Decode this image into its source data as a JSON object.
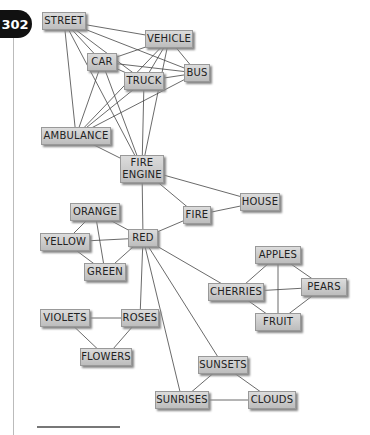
{
  "page_number": "302",
  "nodes": {
    "street": "STREET",
    "vehicle": "VEHICLE",
    "car": "CAR",
    "bus": "BUS",
    "truck": "TRUCK",
    "ambulance": "AMBULANCE",
    "fire_engine": "FIRE\nENGINE",
    "house": "HOUSE",
    "fire": "FIRE",
    "orange": "ORANGE",
    "yellow": "YELLOW",
    "red": "RED",
    "green": "GREEN",
    "apples": "APPLES",
    "cherries": "CHERRIES",
    "pears": "PEARS",
    "fruit": "FRUIT",
    "violets": "VIOLETS",
    "roses": "ROSES",
    "flowers": "FLOWERS",
    "sunsets": "SUNSETS",
    "sunrises": "SUNRISES",
    "clouds": "CLOUDS"
  },
  "edges": [
    [
      "street",
      "vehicle"
    ],
    [
      "street",
      "car"
    ],
    [
      "street",
      "bus"
    ],
    [
      "street",
      "truck"
    ],
    [
      "street",
      "ambulance"
    ],
    [
      "street",
      "fire_engine"
    ],
    [
      "vehicle",
      "car"
    ],
    [
      "vehicle",
      "bus"
    ],
    [
      "vehicle",
      "truck"
    ],
    [
      "vehicle",
      "ambulance"
    ],
    [
      "vehicle",
      "fire_engine"
    ],
    [
      "car",
      "bus"
    ],
    [
      "car",
      "truck"
    ],
    [
      "car",
      "ambulance"
    ],
    [
      "car",
      "fire_engine"
    ],
    [
      "truck",
      "bus"
    ],
    [
      "truck",
      "ambulance"
    ],
    [
      "truck",
      "fire_engine"
    ],
    [
      "bus",
      "ambulance"
    ],
    [
      "ambulance",
      "fire_engine"
    ],
    [
      "fire_engine",
      "house"
    ],
    [
      "fire_engine",
      "fire"
    ],
    [
      "fire_engine",
      "red"
    ],
    [
      "fire",
      "house"
    ],
    [
      "fire",
      "red"
    ],
    [
      "red",
      "orange"
    ],
    [
      "red",
      "yellow"
    ],
    [
      "red",
      "green"
    ],
    [
      "orange",
      "yellow"
    ],
    [
      "orange",
      "green"
    ],
    [
      "yellow",
      "green"
    ],
    [
      "red",
      "roses"
    ],
    [
      "red",
      "cherries"
    ],
    [
      "red",
      "sunsets"
    ],
    [
      "red",
      "sunrises"
    ],
    [
      "apples",
      "cherries"
    ],
    [
      "apples",
      "pears"
    ],
    [
      "apples",
      "fruit"
    ],
    [
      "cherries",
      "pears"
    ],
    [
      "cherries",
      "fruit"
    ],
    [
      "pears",
      "fruit"
    ],
    [
      "violets",
      "roses"
    ],
    [
      "violets",
      "flowers"
    ],
    [
      "roses",
      "flowers"
    ],
    [
      "sunsets",
      "sunrises"
    ],
    [
      "sunsets",
      "clouds"
    ],
    [
      "sunrises",
      "clouds"
    ]
  ]
}
